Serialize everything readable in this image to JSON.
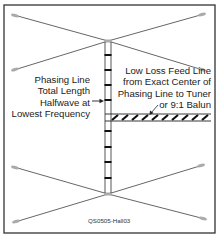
{
  "labels": {
    "phasing_line": [
      "Phasing Line",
      "Total Length",
      "Halfwave at",
      "Lowest Frequency"
    ],
    "feed_line": [
      "Low Loss Feed Line",
      "from Exact Center of",
      "Phasing Line to Tuner",
      "or 9:1 Balun"
    ],
    "figure_id": "QS0505-Hall03"
  },
  "colors": {
    "border": "#333333",
    "wire": "#555555",
    "insulator": "#aaaaaa",
    "spacer": "#111111",
    "text": "#222222"
  },
  "elements": {
    "top_dipole_center": [
      108,
      41
    ],
    "bottom_dipole_center": [
      108,
      194
    ],
    "phasing_line_rungs": 9,
    "feed_line_y": [
      114,
      121
    ]
  }
}
